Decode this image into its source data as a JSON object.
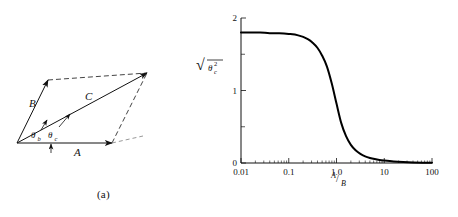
{
  "figure": {
    "panel_a": {
      "caption": "(a)",
      "vector_labels": {
        "a": "A",
        "b": "B",
        "c": "C"
      },
      "angle_labels": {
        "theta_b": "θ",
        "theta_b_sub": "b",
        "theta_c": "θ",
        "theta_c_sub": "c"
      },
      "geometry": {
        "origin": [
          17,
          143
        ],
        "tip_a": [
          112,
          143
        ],
        "tip_b": [
          48,
          80
        ],
        "tip_c": [
          147,
          73
        ],
        "corner_right": [
          143,
          136
        ]
      }
    },
    "panel_b": {
      "caption": "(b)",
      "ylabel_root": "√",
      "ylabel_theta": "θ",
      "ylabel_sub": "c",
      "ylabel_sup": "2",
      "xlabel_num": "A",
      "xlabel_den": "B",
      "xlabel_slash": "/"
    }
  },
  "chart_data": {
    "type": "line",
    "title": "",
    "xlabel": "A/B",
    "ylabel": "sqrt(mean theta_c squared)",
    "xscale": "log",
    "yscale": "linear",
    "xlim": [
      0.01,
      100
    ],
    "ylim": [
      0,
      2
    ],
    "grid": false,
    "legend": null,
    "xticks": [
      0.01,
      0.1,
      1.0,
      10,
      100
    ],
    "xticklabels": [
      "0.01",
      "0.1",
      "1.0",
      "10",
      "100"
    ],
    "yticks": [
      0,
      1,
      2
    ],
    "yticklabels": [
      "0",
      "1",
      "2"
    ],
    "yminorticks": [
      0.5,
      1.5
    ],
    "series": [
      {
        "name": "rms theta_c",
        "x": [
          0.01,
          0.0158,
          0.0251,
          0.0398,
          0.0631,
          0.1,
          0.158,
          0.251,
          0.316,
          0.398,
          0.501,
          0.631,
          0.794,
          1.0,
          1.259,
          1.585,
          2.0,
          2.512,
          3.162,
          3.981,
          5.012,
          6.31,
          7.94,
          10.0,
          15.85,
          25.1,
          39.8,
          63.1,
          100.0
        ],
        "values": [
          1.8,
          1.8,
          1.8,
          1.79,
          1.79,
          1.78,
          1.76,
          1.71,
          1.66,
          1.59,
          1.48,
          1.33,
          1.1,
          0.82,
          0.55,
          0.37,
          0.25,
          0.175,
          0.125,
          0.092,
          0.07,
          0.054,
          0.042,
          0.034,
          0.021,
          0.013,
          0.008,
          0.005,
          0.003
        ]
      }
    ],
    "annotations": [
      {
        "text": "(b)",
        "role": "panel-caption"
      }
    ]
  }
}
